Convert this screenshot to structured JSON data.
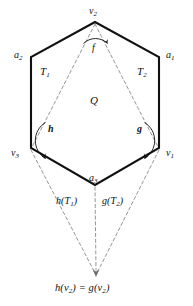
{
  "figure": {
    "background_color": "#ffffff",
    "solid_stroke_color": "#111111",
    "dashed_stroke_color": "#8a8a8a",
    "labels": {
      "vertex_top": "v",
      "vertex_top_sub": "2",
      "vertex_left": "v",
      "vertex_left_sub": "3",
      "vertex_right": "v",
      "vertex_right_sub": "1",
      "edge_left": "a",
      "edge_left_sub": "2",
      "edge_right": "a",
      "edge_right_sub": "1",
      "edge_bottom": "a",
      "edge_bottom_sub": "3",
      "region_left": "T",
      "region_left_sub": "1",
      "region_right": "T",
      "region_right_sub": "2",
      "region_center": "Q",
      "map_f": "f",
      "map_g": "g",
      "map_h": "h",
      "image_left": "h(T",
      "image_left_sub": "1",
      "image_left_tail": ")",
      "image_right": "g(T",
      "image_right_sub": "2",
      "image_right_tail": ")",
      "bottom_lhs": "h(v",
      "bottom_lhs_sub": "2",
      "bottom_mid": ") = g(v",
      "bottom_rhs_sub": "2",
      "bottom_rhs_tail": ")"
    },
    "geometry": {
      "hex_top": [
        95,
        22
      ],
      "hex_upper_left": [
        31,
        57
      ],
      "hex_upper_right": [
        159,
        57
      ],
      "hex_lower_left": [
        31,
        148
      ],
      "hex_lower_right": [
        159,
        148
      ],
      "hex_bottom": [
        95,
        185
      ],
      "apex_bottom": [
        96,
        276
      ]
    }
  }
}
